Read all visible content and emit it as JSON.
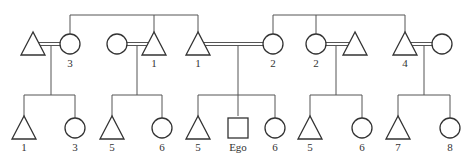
{
  "diagram": {
    "title": "",
    "type": "kinship-chart",
    "colors": {
      "line": "#555555",
      "symbol": "#333333",
      "background": "#ffffff"
    },
    "legend": {
      "triangle": "male",
      "circle": "female",
      "square": "Ego",
      "double-line": "marriage"
    },
    "top_row": [
      {
        "id": "t1",
        "shape": "triangle",
        "x": 33,
        "label": ""
      },
      {
        "id": "t2",
        "shape": "circle",
        "x": 70,
        "label": "3"
      },
      {
        "id": "t3",
        "shape": "circle",
        "x": 117,
        "label": ""
      },
      {
        "id": "t4",
        "shape": "triangle",
        "x": 154,
        "label": "1"
      },
      {
        "id": "t5",
        "shape": "triangle",
        "x": 198,
        "label": "1"
      },
      {
        "id": "t6",
        "shape": "circle",
        "x": 273,
        "label": "2"
      },
      {
        "id": "t7",
        "shape": "circle",
        "x": 316,
        "label": "2"
      },
      {
        "id": "t8",
        "shape": "triangle",
        "x": 355,
        "label": ""
      },
      {
        "id": "t9",
        "shape": "triangle",
        "x": 405,
        "label": "4"
      },
      {
        "id": "t10",
        "shape": "circle",
        "x": 442,
        "label": ""
      }
    ],
    "marriages": [
      {
        "a": "t1",
        "b": "t2",
        "drop_x": 51
      },
      {
        "a": "t3",
        "b": "t4",
        "drop_x": 137
      },
      {
        "a": "t5",
        "b": "t6",
        "drop_x": 238
      },
      {
        "a": "t7",
        "b": "t8",
        "drop_x": 336
      },
      {
        "a": "t9",
        "b": "t10",
        "drop_x": 424
      }
    ],
    "sibling_sets_top": [
      {
        "members": [
          "t2",
          "t4",
          "t5"
        ],
        "y": 15
      },
      {
        "members": [
          "t6",
          "t7",
          "t9"
        ],
        "y": 15
      }
    ],
    "bottom_row": [
      {
        "id": "b1",
        "shape": "triangle",
        "x": 24,
        "label": "1",
        "parent_drop": 51
      },
      {
        "id": "b2",
        "shape": "circle",
        "x": 75,
        "label": "3",
        "parent_drop": 51
      },
      {
        "id": "b3",
        "shape": "triangle",
        "x": 112,
        "label": "5",
        "parent_drop": 137
      },
      {
        "id": "b4",
        "shape": "circle",
        "x": 162,
        "label": "6",
        "parent_drop": 137
      },
      {
        "id": "b5",
        "shape": "triangle",
        "x": 198,
        "label": "5",
        "parent_drop": 238
      },
      {
        "id": "b6",
        "shape": "square",
        "x": 238,
        "label": "Ego",
        "parent_drop": 238
      },
      {
        "id": "b7",
        "shape": "circle",
        "x": 275,
        "label": "6",
        "parent_drop": 238
      },
      {
        "id": "b8",
        "shape": "triangle",
        "x": 310,
        "label": "5",
        "parent_drop": 336
      },
      {
        "id": "b9",
        "shape": "circle",
        "x": 362,
        "label": "6",
        "parent_drop": 336
      },
      {
        "id": "b10",
        "shape": "triangle",
        "x": 398,
        "label": "7",
        "parent_drop": 424
      },
      {
        "id": "b11",
        "shape": "circle",
        "x": 450,
        "label": "8",
        "parent_drop": 424
      }
    ]
  }
}
